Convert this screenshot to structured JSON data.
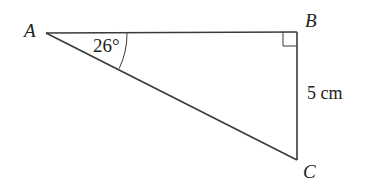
{
  "diagram": {
    "type": "right-triangle",
    "vertices": {
      "A": {
        "label": "A",
        "x": 46,
        "y": 33
      },
      "B": {
        "label": "B",
        "x": 297,
        "y": 32
      },
      "C": {
        "label": "C",
        "x": 297,
        "y": 160
      }
    },
    "angle_label": "26°",
    "side_label": "5 cm",
    "right_angle_at": "B",
    "stroke_color": "#3a3a3a",
    "text_color": "#222222"
  }
}
